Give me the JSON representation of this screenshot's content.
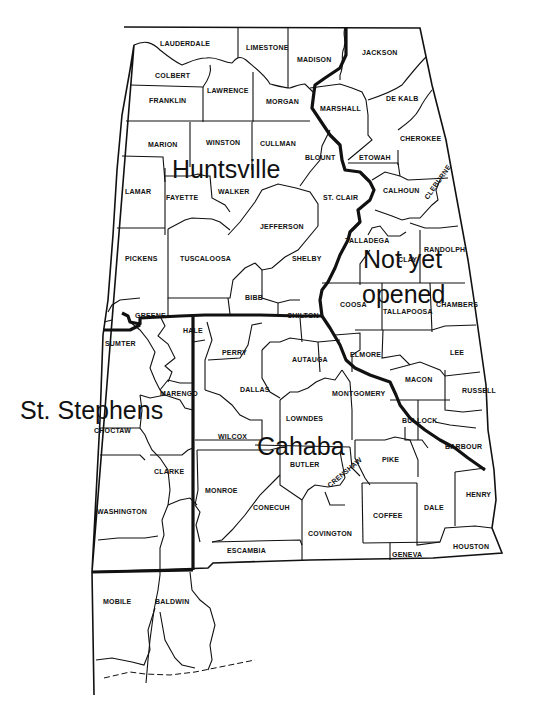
{
  "map": {
    "title": "Alabama land districts",
    "districts": [
      {
        "name": "Huntsville",
        "x": 172,
        "y": 178
      },
      {
        "name": "Not yet",
        "x": 363,
        "y": 268
      },
      {
        "name": "opened",
        "x": 362,
        "y": 303
      },
      {
        "name": "St. Stephens",
        "x": 20,
        "y": 419
      },
      {
        "name": "Cahaba",
        "x": 257,
        "y": 455
      }
    ],
    "counties": [
      {
        "name": "LAUDERDALE",
        "x": 160,
        "y": 46
      },
      {
        "name": "LIMESTONE",
        "x": 246,
        "y": 50
      },
      {
        "name": "MADISON",
        "x": 297,
        "y": 62
      },
      {
        "name": "JACKSON",
        "x": 362,
        "y": 55
      },
      {
        "name": "COLBERT",
        "x": 155,
        "y": 78
      },
      {
        "name": "LAWRENCE",
        "x": 207,
        "y": 93
      },
      {
        "name": "FRANKLIN",
        "x": 149,
        "y": 103
      },
      {
        "name": "MORGAN",
        "x": 266,
        "y": 104
      },
      {
        "name": "MARSHALL",
        "x": 320,
        "y": 111
      },
      {
        "name": "DE KALB",
        "x": 386,
        "y": 101
      },
      {
        "name": "MARION",
        "x": 148,
        "y": 147
      },
      {
        "name": "WINSTON",
        "x": 206,
        "y": 145
      },
      {
        "name": "CULLMAN",
        "x": 260,
        "y": 146
      },
      {
        "name": "CHEROKEE",
        "x": 400,
        "y": 141
      },
      {
        "name": "BLOUNT",
        "x": 305,
        "y": 160
      },
      {
        "name": "ETOWAH",
        "x": 359,
        "y": 160
      },
      {
        "name": "LAMAR",
        "x": 125,
        "y": 194
      },
      {
        "name": "FAYETTE",
        "x": 166,
        "y": 200
      },
      {
        "name": "WALKER",
        "x": 218,
        "y": 194
      },
      {
        "name": "CALHOUN",
        "x": 383,
        "y": 193
      },
      {
        "name": "ST. CLAIR",
        "x": 323,
        "y": 200
      },
      {
        "name": "CLEBURNE",
        "x": 428,
        "y": 200,
        "rotate": -55
      },
      {
        "name": "JEFFERSON",
        "x": 260,
        "y": 229
      },
      {
        "name": "TALLADEGA",
        "x": 345,
        "y": 243
      },
      {
        "name": "RANDOLPH",
        "x": 424,
        "y": 252
      },
      {
        "name": "PICKENS",
        "x": 125,
        "y": 261
      },
      {
        "name": "TUSCALOOSA",
        "x": 180,
        "y": 261
      },
      {
        "name": "SHELBY",
        "x": 292,
        "y": 261
      },
      {
        "name": "CLAY",
        "x": 398,
        "y": 262
      },
      {
        "name": "COOSA",
        "x": 340,
        "y": 307
      },
      {
        "name": "BIBB",
        "x": 245,
        "y": 300
      },
      {
        "name": "CHAMBERS",
        "x": 436,
        "y": 307
      },
      {
        "name": "TALLAPOOSA",
        "x": 383,
        "y": 314
      },
      {
        "name": "GREENE",
        "x": 135,
        "y": 318
      },
      {
        "name": "CHILTON",
        "x": 287,
        "y": 318
      },
      {
        "name": "HALE",
        "x": 183,
        "y": 333
      },
      {
        "name": "SUMTER",
        "x": 105,
        "y": 346
      },
      {
        "name": "PERRY",
        "x": 222,
        "y": 355
      },
      {
        "name": "AUTAUGA",
        "x": 292,
        "y": 362
      },
      {
        "name": "ELMORE",
        "x": 350,
        "y": 357
      },
      {
        "name": "LEE",
        "x": 450,
        "y": 355
      },
      {
        "name": "DALLAS",
        "x": 240,
        "y": 392
      },
      {
        "name": "MONTGOMERY",
        "x": 332,
        "y": 396
      },
      {
        "name": "MACON",
        "x": 405,
        "y": 382
      },
      {
        "name": "RUSSELL",
        "x": 462,
        "y": 393
      },
      {
        "name": "MARENGO",
        "x": 160,
        "y": 396
      },
      {
        "name": "LOWNDES",
        "x": 286,
        "y": 421
      },
      {
        "name": "CHOCTAW",
        "x": 94,
        "y": 433
      },
      {
        "name": "BULLOCK",
        "x": 402,
        "y": 423
      },
      {
        "name": "WILCOX",
        "x": 218,
        "y": 439
      },
      {
        "name": "BARBOUR",
        "x": 445,
        "y": 449
      },
      {
        "name": "BUTLER",
        "x": 290,
        "y": 467
      },
      {
        "name": "PIKE",
        "x": 382,
        "y": 462
      },
      {
        "name": "CRENSHAW",
        "x": 330,
        "y": 488,
        "rotate": -40
      },
      {
        "name": "CLARKE",
        "x": 154,
        "y": 474
      },
      {
        "name": "HENRY",
        "x": 466,
        "y": 497
      },
      {
        "name": "MONROE",
        "x": 205,
        "y": 493
      },
      {
        "name": "CONECUH",
        "x": 253,
        "y": 510
      },
      {
        "name": "WASHINGTON",
        "x": 97,
        "y": 514
      },
      {
        "name": "DALE",
        "x": 424,
        "y": 510
      },
      {
        "name": "COFFEE",
        "x": 373,
        "y": 518
      },
      {
        "name": "COVINGTON",
        "x": 308,
        "y": 536
      },
      {
        "name": "ESCAMBIA",
        "x": 227,
        "y": 553
      },
      {
        "name": "HOUSTON",
        "x": 453,
        "y": 549
      },
      {
        "name": "GENEVA",
        "x": 392,
        "y": 557
      },
      {
        "name": "MOBILE",
        "x": 103,
        "y": 604
      },
      {
        "name": "BALDWIN",
        "x": 155,
        "y": 604
      }
    ]
  }
}
